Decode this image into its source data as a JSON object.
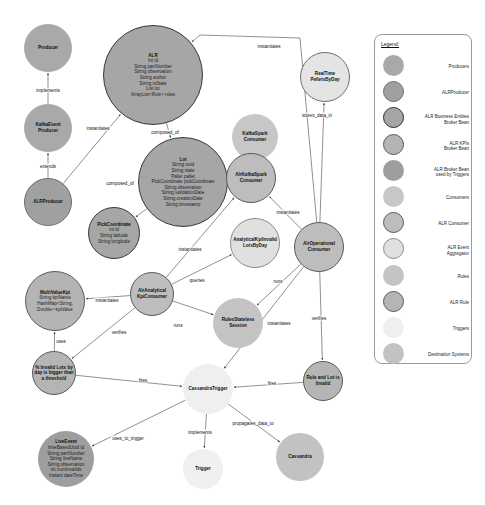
{
  "colors": {
    "producer": "#a9a9a9",
    "alr_producer": "#a0a0a0",
    "business_entity": "#a6a6a6",
    "kpi_bean": "#b4b4b4",
    "trigger_bean": "#9e9e9e",
    "consumer": "#c7c7c7",
    "alr_consumer": "#bdbdbd",
    "aggregator": "#e0e0e0",
    "rules": "#c4c4c4",
    "alr_rule": "#b5b5b5",
    "triggers": "#eeeeee",
    "destination": "#c2c2c2",
    "edge": "#444444",
    "dark_border": "#3a3a3a",
    "mid_border": "#6e6e6e"
  },
  "nodes": [
    {
      "id": "producer",
      "cx": 48,
      "cy": 48,
      "r": 24,
      "fill": "#a9a9a9",
      "border": "none",
      "title": "Producer",
      "attrs": []
    },
    {
      "id": "alr",
      "cx": 153,
      "cy": 75,
      "r": 50,
      "fill": "#a6a6a6",
      "border": "1.2px solid #3a3a3a",
      "title": "ALR",
      "attrs": [
        "Int id",
        "String partNumber",
        "String observation",
        "String author",
        "String isState",
        "List lot",
        "ArrayList<Rule> rules"
      ]
    },
    {
      "id": "kafka-event-producer",
      "cx": 48,
      "cy": 128,
      "r": 24,
      "fill": "#a9a9a9",
      "border": "none",
      "title": "KafkaEvent\nProducer",
      "attrs": []
    },
    {
      "id": "alr-producer",
      "cx": 48,
      "cy": 202,
      "r": 24,
      "fill": "#a0a0a0",
      "border": "0.8px solid #6e6e6e",
      "title": "ALRProducer",
      "attrs": []
    },
    {
      "id": "lot",
      "cx": 183,
      "cy": 182,
      "r": 45,
      "fill": "#a6a6a6",
      "border": "1.2px solid #3a3a3a",
      "title": "Lot",
      "attrs": [
        "String uuid",
        "String state",
        "Pallet pallet",
        "PickCoordinate pickCoordinate",
        "String observation",
        "String validationDate",
        "String creationDate",
        "String timestamp"
      ]
    },
    {
      "id": "pick-coordinate",
      "cx": 114,
      "cy": 233,
      "r": 26,
      "fill": "#a6a6a6",
      "border": "1.2px solid #3a3a3a",
      "title": "PickCoordinate",
      "attrs": [
        "int id",
        "String latitude",
        "String longitude"
      ]
    },
    {
      "id": "realtime-pellets-by-day",
      "cx": 325,
      "cy": 77,
      "r": 25,
      "fill": "#e4e4e4",
      "border": "1px solid #6e6e6e",
      "title": "RealTime\nPelletsByDay",
      "attrs": []
    },
    {
      "id": "kafka-spark-consumer",
      "cx": 255,
      "cy": 137,
      "r": 23,
      "fill": "#c7c7c7",
      "border": "none",
      "title": "KafkaSpark\nConsumer",
      "attrs": []
    },
    {
      "id": "alr-kafka-spark-consumer",
      "cx": 251,
      "cy": 178,
      "r": 25,
      "fill": "#bdbdbd",
      "border": "1px solid #5a5a5a",
      "title": "AlrKafkaSpark\nConsumer",
      "attrs": []
    },
    {
      "id": "analytical-kpi-invalid-lots-by-day",
      "cx": 255,
      "cy": 243,
      "r": 25,
      "fill": "#e0e0e0",
      "border": "1px solid #8a8a8a",
      "title": "AnalyticalKpiInvalid\nLotsByDay",
      "attrs": []
    },
    {
      "id": "alr-operational-consumer",
      "cx": 319,
      "cy": 247,
      "r": 25,
      "fill": "#bdbdbd",
      "border": "1px solid #5a5a5a",
      "title": "AlrOperational\nConsumer",
      "attrs": []
    },
    {
      "id": "alr-analytical-kpi-consumer",
      "cx": 152,
      "cy": 294,
      "r": 22,
      "fill": "#bdbdbd",
      "border": "1px solid #5a5a5a",
      "title": "AlrAnalytical\nKpiConsumer",
      "attrs": []
    },
    {
      "id": "multi-value-kpi",
      "cx": 55,
      "cy": 301,
      "r": 30,
      "fill": "#b4b4b4",
      "border": "1px solid #5a5a5a",
      "title": "MultiValueKpi",
      "attrs": [
        "String kpiName",
        "HashMap<String,",
        "Double> kpiValue"
      ]
    },
    {
      "id": "rules-stateless-session",
      "cx": 238,
      "cy": 323,
      "r": 25,
      "fill": "#c4c4c4",
      "border": "none",
      "title": "RulesStateless\nSession",
      "attrs": []
    },
    {
      "id": "invalid-lots-threshold",
      "cx": 54,
      "cy": 373,
      "r": 22,
      "fill": "#b5b5b5",
      "border": "1px solid #5a5a5a",
      "title": "% Invalid Lots by\nday is bigger than\na threshold",
      "attrs": []
    },
    {
      "id": "cassandra-trigger",
      "cx": 208,
      "cy": 389,
      "r": 25,
      "fill": "#efefef",
      "border": "none",
      "title": "CassandraTrigger",
      "attrs": []
    },
    {
      "id": "rule-and-lot-invalid",
      "cx": 323,
      "cy": 381,
      "r": 20,
      "fill": "#b5b5b5",
      "border": "1px solid #5a5a5a",
      "title": "Rule and Lot is\nInvalid",
      "attrs": []
    },
    {
      "id": "live-event",
      "cx": 66,
      "cy": 459,
      "r": 28,
      "fill": "#9e9e9e",
      "border": "none",
      "title": "LiveEvent",
      "attrs": [
        "timeBasedUuid id",
        "String partNumber",
        "String lineName",
        "String observation",
        "int numInvalids",
        "Instant dateTime"
      ]
    },
    {
      "id": "trigger",
      "cx": 203,
      "cy": 469,
      "r": 20,
      "fill": "#f0f0f0",
      "border": "none",
      "title": "Trigger",
      "attrs": []
    },
    {
      "id": "cassandra",
      "cx": 300,
      "cy": 457,
      "r": 24,
      "fill": "#c2c2c2",
      "border": "none",
      "title": "Cassandra",
      "attrs": []
    }
  ],
  "edges": [
    {
      "from": "kafka-event-producer",
      "to": "producer",
      "label": "implements",
      "lx": 48,
      "ly": 90
    },
    {
      "from": "alr-producer",
      "to": "kafka-event-producer",
      "label": "extends",
      "lx": 48,
      "ly": 166
    },
    {
      "from": "alr-producer",
      "to": "alr",
      "label": "instantiates",
      "lx": 98,
      "ly": 128
    },
    {
      "from": "alr",
      "to": "lot",
      "label": "composed_of",
      "lx": 165,
      "ly": 132
    },
    {
      "from": "lot",
      "to": "pick-coordinate",
      "label": "composed_of",
      "lx": 120,
      "ly": 183
    },
    {
      "from": "alr-operational-consumer",
      "to": "alr",
      "label": "instantiates",
      "lx": 269,
      "ly": 46,
      "via": [
        [
          300,
          38
        ],
        [
          200,
          35
        ]
      ]
    },
    {
      "from": "alr-operational-consumer",
      "to": "realtime-pellets-by-day",
      "label": "stores_data_in",
      "lx": 317,
      "ly": 115
    },
    {
      "from": "alr-kafka-spark-consumer",
      "to": "kafka-spark-consumer",
      "label": "extends",
      "lx": 251,
      "ly": 160
    },
    {
      "from": "alr-operational-consumer",
      "to": "alr-kafka-spark-consumer",
      "label": "instantiates",
      "lx": 288,
      "ly": 212
    },
    {
      "from": "alr-analytical-kpi-consumer",
      "to": "alr-kafka-spark-consumer",
      "label": "instantiates",
      "lx": 190,
      "ly": 249
    },
    {
      "from": "alr-analytical-kpi-consumer",
      "to": "analytical-kpi-invalid-lots-by-day",
      "label": "queries",
      "lx": 197,
      "ly": 280
    },
    {
      "from": "alr-analytical-kpi-consumer",
      "to": "multi-value-kpi",
      "label": "instantiates",
      "lx": 107,
      "ly": 300
    },
    {
      "from": "alr-analytical-kpi-consumer",
      "to": "rules-stateless-session",
      "label": "runs",
      "lx": 178,
      "ly": 325
    },
    {
      "from": "alr-operational-consumer",
      "to": "rules-stateless-session",
      "label": "runs",
      "lx": 278,
      "ly": 281
    },
    {
      "from": "alr-operational-consumer",
      "to": "cassandra-trigger",
      "label": "instantiates",
      "lx": 279,
      "ly": 323
    },
    {
      "from": "alr-operational-consumer",
      "to": "rule-and-lot-invalid",
      "label": "verifies",
      "lx": 319,
      "ly": 318
    },
    {
      "from": "alr-analytical-kpi-consumer",
      "to": "invalid-lots-threshold",
      "label": "verifies",
      "lx": 119,
      "ly": 332
    },
    {
      "from": "invalid-lots-threshold",
      "to": "multi-value-kpi",
      "label": "uses",
      "lx": 61,
      "ly": 341
    },
    {
      "from": "invalid-lots-threshold",
      "to": "cassandra-trigger",
      "label": "fires",
      "lx": 143,
      "ly": 380
    },
    {
      "from": "rule-and-lot-invalid",
      "to": "cassandra-trigger",
      "label": "fires",
      "lx": 272,
      "ly": 383
    },
    {
      "from": "cassandra-trigger",
      "to": "live-event",
      "label": "uses_to_trigger",
      "lx": 128,
      "ly": 438
    },
    {
      "from": "cassandra-trigger",
      "to": "trigger",
      "label": "implements",
      "lx": 200,
      "ly": 432
    },
    {
      "from": "cassandra-trigger",
      "to": "cassandra",
      "label": "propagates_data_to",
      "lx": 253,
      "ly": 423
    }
  ],
  "legend": {
    "title": "Legend:",
    "items": [
      {
        "label": "Producers",
        "fill": "#a9a9a9",
        "border": "none"
      },
      {
        "label": "ALRProducer",
        "fill": "#a0a0a0",
        "border": "1px solid #6e6e6e"
      },
      {
        "label": "ALR Business Entities\nBroker Bean",
        "fill": "#a6a6a6",
        "border": "1.5px solid #2e2e2e"
      },
      {
        "label": "ALR KPIs\nBroker Bean",
        "fill": "#b4b4b4",
        "border": "1px solid #5a5a5a"
      },
      {
        "label": "ALR Broker Bean\nused by Triggers",
        "fill": "#9e9e9e",
        "border": "none"
      },
      {
        "label": "Consumers",
        "fill": "#c7c7c7",
        "border": "none"
      },
      {
        "label": "ALR Consumer",
        "fill": "#bdbdbd",
        "border": "1px solid #5a5a5a"
      },
      {
        "label": "ALR Event\nAggregator",
        "fill": "#e0e0e0",
        "border": "1px solid #8a8a8a"
      },
      {
        "label": "Rules",
        "fill": "#c4c4c4",
        "border": "none"
      },
      {
        "label": "ALR Rule",
        "fill": "#b5b5b5",
        "border": "1px solid #5a5a5a"
      },
      {
        "label": "Triggers",
        "fill": "#efefef",
        "border": "none"
      },
      {
        "label": "Destination Systems",
        "fill": "#c2c2c2",
        "border": "none"
      }
    ]
  }
}
